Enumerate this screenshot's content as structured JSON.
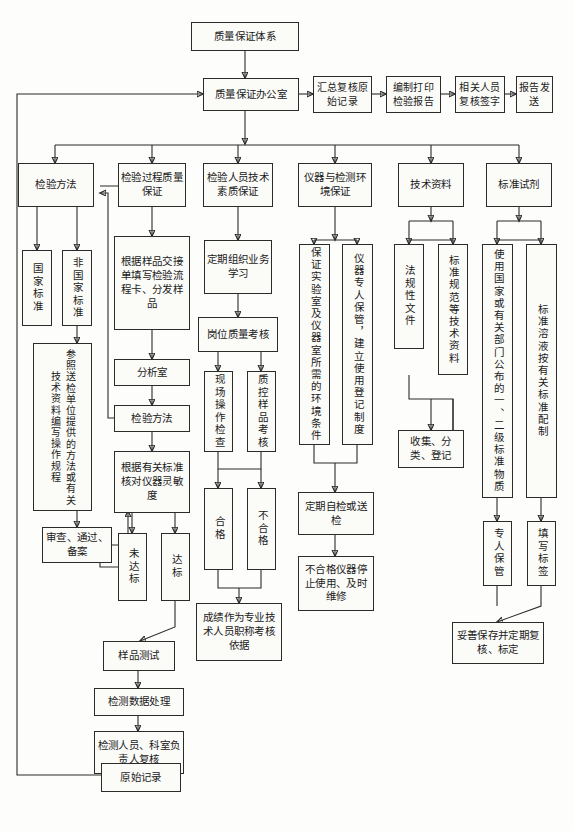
{
  "nodes": {
    "root": "质量保证体系",
    "office": "质量保证办公室",
    "report_chain": [
      "汇总复核原始记录",
      "编制打印检验报告",
      "相关人员复核签字",
      "报告发送"
    ],
    "branches": [
      "检验方法",
      "检验过程质量保证",
      "检验人员技术素质保证",
      "仪器与检测环境保证",
      "技术资料",
      "标准试剂"
    ],
    "col1": {
      "national_standard": "国家标准",
      "non_national_standard": "非国家标准",
      "write_sop": "参照送检单位提供的方法或有关技术资料编写操作规程",
      "review": "审查、通过、备案"
    },
    "col2": {
      "fill_flow_card": "根据样品交接单填写检验流程卡、分发样品",
      "analysis_room": "分析室",
      "test_method": "检验方法",
      "check_sensitivity": "根据有关标准核对仪器灵敏度",
      "not_reached": "未达标",
      "reached": "达标",
      "sample_test": "样品测试",
      "data_process": "检测数据处理",
      "recheck": "检测人员、科室负责人复核",
      "raw_record": "原始记录"
    },
    "col3": {
      "study": "定期组织业务学习",
      "post_assess": "岗位质量考核",
      "field_check": "现场操作检查",
      "qc_sample": "质控样品考核",
      "pass": "合格",
      "fail": "不合格",
      "result_basis": "成绩作为专业技术人员职称考核依据"
    },
    "col4": {
      "env_condition": "保证实验室及仪器室所需的环境条件",
      "instrument_keeper": "仪器专人保管，建立使用登记制度",
      "self_check": "定期自检或送检",
      "unqualified": "不合格仪器停止使用、及时维修"
    },
    "col5": {
      "legal_docs": "法规性文件",
      "standard_docs": "标准规范等技术资料",
      "collect": "收集、分类、登记"
    },
    "col6": {
      "use_standard_material": "使用国家或有关部门公布的一、二级标准物质",
      "standard_solution": "标准溶液按有关标准配制",
      "keeper": "专人保管",
      "label": "填写标签",
      "store": "妥善保存并定期复核、标定"
    }
  }
}
